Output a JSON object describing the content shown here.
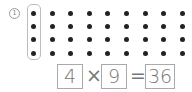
{
  "problem": {
    "number_label": "1",
    "grid": {
      "rows": 4,
      "cols": 9,
      "highlighted_column": 1
    },
    "equation": {
      "factor_a": "4",
      "operator": "×",
      "factor_b": "9",
      "equals": "=",
      "product": "36"
    }
  }
}
